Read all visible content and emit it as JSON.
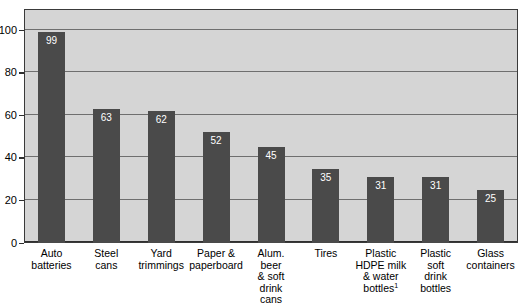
{
  "chart_data": {
    "type": "bar",
    "title": "",
    "subtitle": "",
    "xlabel": "",
    "ylabel": "",
    "ylim": [
      0,
      110
    ],
    "yticks": [
      0,
      20,
      40,
      60,
      80,
      100
    ],
    "ytick_labels": [
      "0",
      "20",
      "40",
      "60",
      "80",
      "100"
    ],
    "grid": true,
    "legend": false,
    "categories": [
      "Auto batteries",
      "Steel cans",
      "Yard trimmings",
      "Paper & paperboard",
      "Alum. beer & soft drink cans",
      "Tires",
      "Plastic HDPE milk & water bottles",
      "Plastic soft drink bottles",
      "Glass containers"
    ],
    "values": [
      99,
      63,
      62,
      52,
      45,
      35,
      31,
      31,
      25
    ],
    "value_labels": [
      "99",
      "63",
      "62",
      "52",
      "45",
      "35",
      "31",
      "31",
      "25"
    ],
    "bar_color": "#4a4a4a",
    "plot_background": "#d5d5d5",
    "gridline_color": "#6f6f6f",
    "axis_color": "#2f2f2f",
    "value_label_color": "#ffffff"
  },
  "category_label_lines": [
    [
      "Auto",
      "batteries"
    ],
    [
      "Steel",
      "cans"
    ],
    [
      "Yard",
      "trimmings"
    ],
    [
      "Paper &",
      "paperboard"
    ],
    [
      "Alum.",
      "beer",
      "& soft",
      "drink",
      "cans"
    ],
    [
      "Tires"
    ],
    [
      "Plastic",
      "HDPE milk",
      "& water",
      "bottles"
    ],
    [
      "Plastic",
      "soft",
      "drink",
      "bottles"
    ],
    [
      "Glass",
      "containers"
    ]
  ],
  "footnote_marker": "1"
}
